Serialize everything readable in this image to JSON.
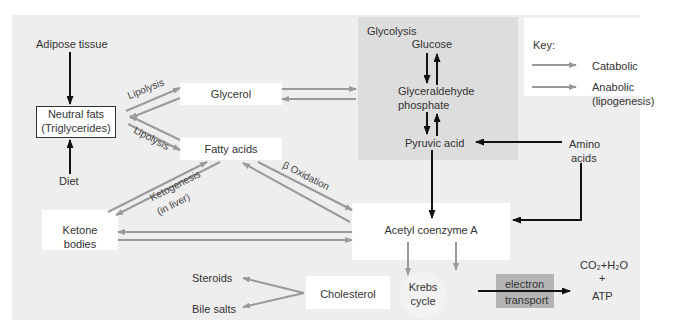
{
  "diagram": {
    "title_region": "Glycolysis",
    "nodes": {
      "adipose": "Adipose tissue",
      "neutral_fats_1": "Neutral fats",
      "neutral_fats_2": "(Triglycerides)",
      "diet": "Diet",
      "glycerol": "Glycerol",
      "fatty_acids": "Fatty acids",
      "ketone_1": "Ketone",
      "ketone_2": "bodies",
      "glucose": "Glucose",
      "g3p_1": "Glyceraldehyde",
      "g3p_2": "phosphate",
      "pyruvic": "Pyruvic acid",
      "amino_1": "Amino",
      "amino_2": "acids",
      "acetyl": "Acetyl coenzyme A",
      "cholesterol": "Cholesterol",
      "steroids": "Steroids",
      "bile": "Bile salts",
      "krebs_1": "Krebs",
      "krebs_2": "cycle",
      "et_1": "electron",
      "et_2": "transport",
      "products_1": "CO₂+H₂O",
      "products_plus": "+",
      "products_2": "ATP"
    },
    "edge_labels": {
      "lipolysis_top": "Lipolysis",
      "lipolysis_bottom": "Lipolysis",
      "ketogenesis_1": "Ketogenesis",
      "ketogenesis_2": "(in liver)",
      "beta_oxidation": "β Oxidation"
    },
    "key": {
      "title": "Key:",
      "catabolic": "Catabolic",
      "anabolic_1": "Anabolic",
      "anabolic_2": "(lipogenesis)"
    },
    "colors": {
      "panel": "#eeeeee",
      "glycolysis_region": "#dddddd",
      "arrow_gray": "#9a9a9a",
      "arrow_black": "#111111",
      "electron_transport": "#b5b5b5"
    }
  }
}
